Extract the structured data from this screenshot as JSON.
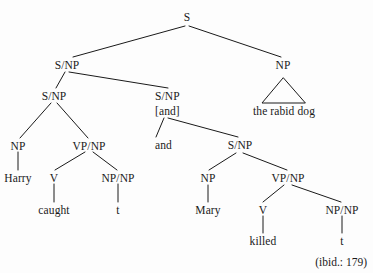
{
  "figure": {
    "type": "syntax-tree-diagram",
    "caption": "(ibid.: 179)",
    "background_color": "#fdfdfd",
    "text_color": "#1a1a1a",
    "line_color": "#1a1a1a"
  },
  "nodes": {
    "root_s": "S",
    "snp_left_top": "S/NP",
    "np_right": "NP",
    "snp_left_mid": "S/NP",
    "snp_and": "S/NP",
    "snp_and_feature": "[and]",
    "np_harry": "NP",
    "vpnp_caught": "VP/NP",
    "and_word": "and",
    "snp_inner": "S/NP",
    "harry": "Harry",
    "v_caught": "V",
    "npnp_trace1": "NP/NP",
    "np_mary": "NP",
    "vpnp_killed": "VP/NP",
    "caught": "caught",
    "trace1": "t",
    "mary": "Mary",
    "v_killed": "V",
    "npnp_trace2": "NP/NP",
    "killed": "killed",
    "trace2": "t",
    "the_rabid_dog": "the rabid dog"
  }
}
